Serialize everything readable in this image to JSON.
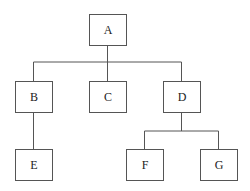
{
  "diagram": {
    "type": "tree",
    "nodes": [
      {
        "id": "A",
        "label": "A",
        "x": 89,
        "y": 14,
        "w": 37,
        "h": 31
      },
      {
        "id": "B",
        "label": "B",
        "x": 15,
        "y": 81,
        "w": 37,
        "h": 31
      },
      {
        "id": "C",
        "label": "C",
        "x": 89,
        "y": 81,
        "w": 37,
        "h": 31
      },
      {
        "id": "D",
        "label": "D",
        "x": 163,
        "y": 81,
        "w": 37,
        "h": 31
      },
      {
        "id": "E",
        "label": "E",
        "x": 15,
        "y": 149,
        "w": 37,
        "h": 31
      },
      {
        "id": "F",
        "label": "F",
        "x": 126,
        "y": 149,
        "w": 37,
        "h": 31
      },
      {
        "id": "G",
        "label": "G",
        "x": 200,
        "y": 149,
        "w": 37,
        "h": 31
      }
    ],
    "edges": [
      {
        "from": "A",
        "to": "B"
      },
      {
        "from": "A",
        "to": "C"
      },
      {
        "from": "A",
        "to": "D"
      },
      {
        "from": "B",
        "to": "E"
      },
      {
        "from": "D",
        "to": "F"
      },
      {
        "from": "D",
        "to": "G"
      }
    ]
  }
}
